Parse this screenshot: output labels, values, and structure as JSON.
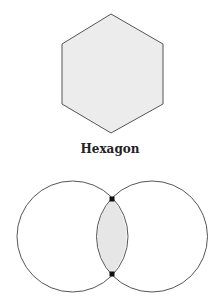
{
  "hexagon": {
    "label": "Hexagon",
    "fill": "#ececec",
    "stroke": "#555555"
  },
  "venn": {
    "circle_count": 2,
    "intersection_fill": "#e6e6e6",
    "stroke": "#555555",
    "intersection_points": 2
  }
}
